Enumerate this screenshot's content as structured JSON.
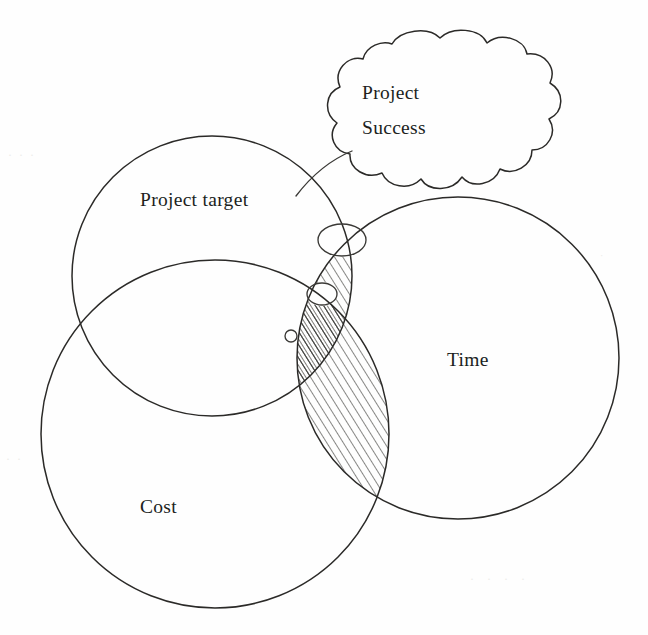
{
  "figure": {
    "type": "venn-diagram",
    "background_color": "#fefefe",
    "ink_color": "#2b2a28",
    "width": 648,
    "height": 635
  },
  "labels": {
    "project_target": "Project target",
    "time": "Time",
    "cost": "Cost",
    "cloud_line1": "Project",
    "cloud_line2": "Success"
  },
  "sets": [
    {
      "id": "project-target",
      "label": "Project target",
      "cx": 212,
      "cy": 276,
      "r": 140,
      "label_x": 140,
      "label_y": 206
    },
    {
      "id": "cost",
      "label": "Cost",
      "cx": 215,
      "cy": 434,
      "r": 174,
      "label_x": 140,
      "label_y": 513
    },
    {
      "id": "time",
      "label": "Time",
      "cx": 458,
      "cy": 358,
      "r": 161,
      "label_x": 447,
      "label_y": 366
    }
  ],
  "callout": {
    "id": "project-success-cloud",
    "label_line1": "Project",
    "label_line2": "Success",
    "cx": 440,
    "cy": 113,
    "text_x": 362,
    "text_y1": 99,
    "text_y2": 134
  },
  "thought_trail": [
    {
      "id": "bubble-large",
      "cx": 342,
      "cy": 240,
      "rx": 24,
      "ry": 16
    },
    {
      "id": "bubble-medium",
      "cx": 322,
      "cy": 294,
      "rx": 15,
      "ry": 11
    },
    {
      "id": "bubble-small",
      "cx": 291,
      "cy": 336,
      "rx": 6,
      "ry": 6
    }
  ],
  "hatched_region": {
    "id": "success-overlap",
    "description": "Hatched lens where Time overlaps Project target and Cost",
    "hatch_angle_deg": 32,
    "hatch_spacing_px": 7
  },
  "ghosts": {
    "top_left": "· · ·",
    "mid_left": "· ·",
    "bottom_right": "· · · ·",
    "mid_right": "·"
  }
}
